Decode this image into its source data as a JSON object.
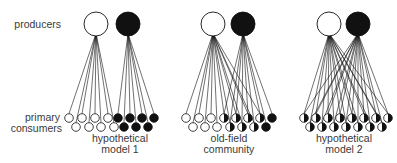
{
  "labels": {
    "producers": "producers",
    "primary": "primary",
    "consumers": "consumers"
  },
  "panels": [
    {
      "id": "hypothetical-model-1",
      "caption_line1": "hypothetical",
      "caption_line2": "model 1",
      "producers": [
        {
          "x": 96,
          "y": 24,
          "fill": "white"
        },
        {
          "x": 128,
          "y": 24,
          "fill": "black"
        }
      ],
      "consumers_top": [
        {
          "x": 69,
          "fill": "white"
        },
        {
          "x": 82,
          "fill": "white"
        },
        {
          "x": 95,
          "fill": "white"
        },
        {
          "x": 108,
          "fill": "white"
        },
        {
          "x": 118,
          "fill": "black"
        },
        {
          "x": 130,
          "fill": "black"
        },
        {
          "x": 142,
          "fill": "black"
        },
        {
          "x": 154,
          "fill": "black"
        }
      ],
      "consumers_bottom": [
        {
          "x": 76,
          "fill": "white"
        },
        {
          "x": 89,
          "fill": "white"
        },
        {
          "x": 101,
          "fill": "white"
        },
        {
          "x": 114,
          "fill": "white"
        },
        {
          "x": 124,
          "fill": "black"
        },
        {
          "x": 136,
          "fill": "black"
        },
        {
          "x": 148,
          "fill": "black"
        }
      ],
      "links": "own-color"
    },
    {
      "id": "old-field-community",
      "caption_line1": "old-field",
      "caption_line2": "community",
      "producers": [
        {
          "x": 213,
          "y": 24,
          "fill": "white"
        },
        {
          "x": 243,
          "y": 24,
          "fill": "black"
        }
      ],
      "consumers_top": [
        {
          "x": 186,
          "fill": "white"
        },
        {
          "x": 199,
          "fill": "white"
        },
        {
          "x": 211,
          "fill": "white"
        },
        {
          "x": 224,
          "fill": "half"
        },
        {
          "x": 236,
          "fill": "half"
        },
        {
          "x": 248,
          "fill": "half"
        },
        {
          "x": 260,
          "fill": "half"
        },
        {
          "x": 272,
          "fill": "black"
        }
      ],
      "consumers_bottom": [
        {
          "x": 193,
          "fill": "white"
        },
        {
          "x": 205,
          "fill": "white"
        },
        {
          "x": 217,
          "fill": "white"
        },
        {
          "x": 230,
          "fill": "half"
        },
        {
          "x": 242,
          "fill": "half"
        },
        {
          "x": 254,
          "fill": "half"
        },
        {
          "x": 266,
          "fill": "black"
        }
      ],
      "links": "by-fill"
    },
    {
      "id": "hypothetical-model-2",
      "caption_line1": "hypothetical",
      "caption_line2": "model 2",
      "producers": [
        {
          "x": 329,
          "y": 24,
          "fill": "white"
        },
        {
          "x": 358,
          "y": 24,
          "fill": "black"
        }
      ],
      "consumers_top": [
        {
          "x": 304,
          "fill": "half"
        },
        {
          "x": 316,
          "fill": "half"
        },
        {
          "x": 328,
          "fill": "half"
        },
        {
          "x": 340,
          "fill": "half"
        },
        {
          "x": 352,
          "fill": "half"
        },
        {
          "x": 364,
          "fill": "half"
        },
        {
          "x": 376,
          "fill": "half"
        },
        {
          "x": 388,
          "fill": "half"
        }
      ],
      "consumers_bottom": [
        {
          "x": 310,
          "fill": "half"
        },
        {
          "x": 322,
          "fill": "half"
        },
        {
          "x": 334,
          "fill": "half"
        },
        {
          "x": 346,
          "fill": "half"
        },
        {
          "x": 358,
          "fill": "half"
        },
        {
          "x": 370,
          "fill": "half"
        },
        {
          "x": 382,
          "fill": "half"
        }
      ],
      "links": "by-fill"
    }
  ],
  "layout": {
    "producer_radius": 12,
    "consumer_radius": 4.3,
    "top_row_y": 118,
    "bottom_row_y": 127,
    "ink": "#111111",
    "paper": "#ffffff"
  }
}
